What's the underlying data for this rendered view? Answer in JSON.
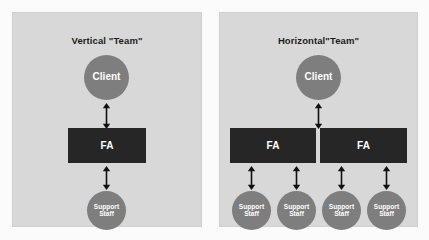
{
  "figure": {
    "background_color": "#fbfbfb",
    "panel_color": "#d8d8d8",
    "node_circle_color": "#7e7e7e",
    "fa_box_color": "#262626",
    "text_color_on_fill": "#ffffff",
    "title_color": "#1c1c1c"
  },
  "panels": [
    {
      "id": "vertical",
      "title": "Vertical \"Team\"",
      "client": {
        "label": "Client"
      },
      "fa_boxes": [
        {
          "label": "FA"
        }
      ],
      "support_staff": [
        {
          "line1": "Support",
          "line2": "Staff"
        }
      ],
      "connectors": [
        {
          "name": "client-to-fa",
          "type": "double-arrow",
          "orientation": "vertical"
        },
        {
          "name": "fa-to-support-staff",
          "type": "double-arrow",
          "orientation": "vertical"
        }
      ]
    },
    {
      "id": "horizontal",
      "title": "Horizontal\"Team\"",
      "client": {
        "label": "Client"
      },
      "fa_boxes": [
        {
          "label": "FA"
        },
        {
          "label": "FA"
        }
      ],
      "support_staff": [
        {
          "line1": "Support",
          "line2": "Staff"
        },
        {
          "line1": "Support",
          "line2": "Staff"
        },
        {
          "line1": "Support",
          "line2": "Staff"
        },
        {
          "line1": "Support",
          "line2": "Staff"
        }
      ],
      "connectors": [
        {
          "name": "client-to-fa",
          "type": "double-arrow",
          "orientation": "vertical"
        },
        {
          "name": "fa1-to-support-staff-1",
          "type": "double-arrow",
          "orientation": "vertical"
        },
        {
          "name": "fa1-to-support-staff-2",
          "type": "double-arrow",
          "orientation": "vertical"
        },
        {
          "name": "fa2-to-support-staff-3",
          "type": "double-arrow",
          "orientation": "vertical"
        },
        {
          "name": "fa2-to-support-staff-4",
          "type": "double-arrow",
          "orientation": "vertical"
        }
      ]
    }
  ]
}
